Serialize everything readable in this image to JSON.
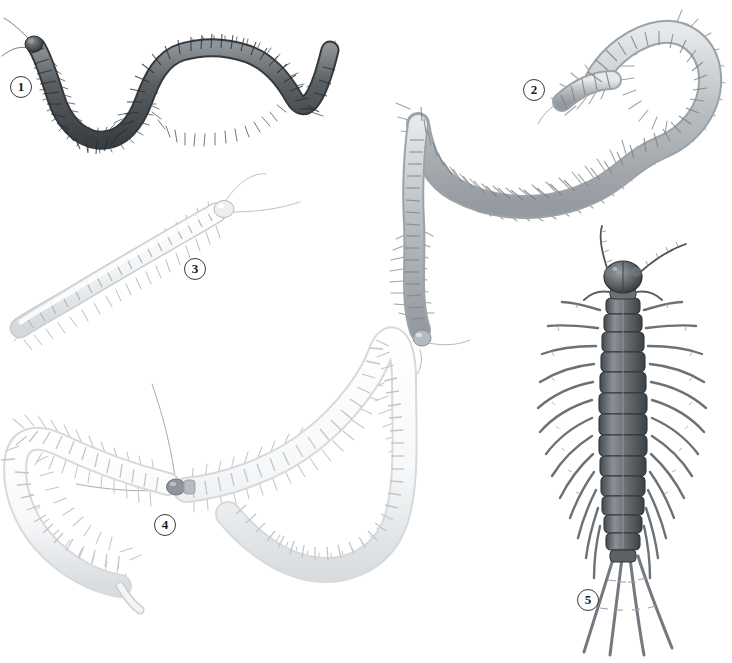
{
  "plate": {
    "title": "Centipede species comparison plate",
    "description": "Grayscale scientific illustration plate of five centipede specimens on a white background",
    "background_color": "#ffffff",
    "width": 732,
    "height": 663
  },
  "figures": [
    {
      "number": "1",
      "name": "specimen-1",
      "common_name": "dark banded centipede",
      "pose": "S-curved, sinuous, horizontal",
      "color": "#555a5e",
      "body_color_light": "#8e9498",
      "body_color_dark": "#3e4347",
      "segments": 46,
      "legs": "numerous fine bristled legs along both sides",
      "antennae": "two long thin antennae at left head",
      "head_position": "left",
      "label_position": {
        "x": 10,
        "y": 76
      }
    },
    {
      "number": "2",
      "name": "specimen-2",
      "common_name": "large pale scolopendromorph centipede",
      "pose": "long undulating S-curve from upper right to lower centre",
      "color": "#b9bec2",
      "body_color_light": "#e2e5e7",
      "body_color_dark": "#9aa0a5",
      "segments": 62,
      "legs": "long spiky legs projecting from each segment",
      "antennae": "two antennae at lower head end",
      "head_position": "lower-left end",
      "label_position": {
        "x": 523,
        "y": 79
      }
    },
    {
      "number": "3",
      "name": "specimen-3",
      "common_name": "pale soil centipede",
      "pose": "gentle diagonal arc from lower-left to upper-right",
      "color": "#e8eaec",
      "body_color_light": "#fbfbfc",
      "body_color_dark": "#c6cace",
      "segments": 28,
      "legs": "short fine legs on both sides",
      "antennae": "two very long thin antennae at upper right head",
      "head_position": "upper-right",
      "label_position": {
        "x": 184,
        "y": 258
      }
    },
    {
      "number": "4",
      "name": "specimen-4",
      "common_name": "white geophilomorph centipede",
      "pose": "large loop / heart-shaped coil",
      "color": "#eff1f2",
      "body_color_light": "#ffffff",
      "body_color_dark": "#cfd3d6",
      "segments": 66,
      "legs": "short spiky legs at every segment",
      "antennae": "two long curving antennae from the small dark head",
      "head_color": "#8b9095",
      "head_position": "centre-left of coil",
      "label_position": {
        "x": 154,
        "y": 514
      }
    },
    {
      "number": "5",
      "name": "specimen-5",
      "common_name": "stone centipede, dorsal view",
      "pose": "straight, head up, dorsal aspect",
      "color": "#5d6266",
      "body_color_light": "#989ea3",
      "body_color_dark": "#3d4246",
      "segments": 16,
      "leg_pairs": 15,
      "legs": "15 pairs of long lateral legs plus elongated trailing rear legs",
      "antennae": "two long segmented antennae splayed upward",
      "head_position": "top",
      "label_position": {
        "x": 577,
        "y": 589
      }
    }
  ],
  "label_style": {
    "shape": "circle-outline",
    "text_color": "#1a1a1a",
    "border_color": "#3a3a3a",
    "fill_color": "#ffffff"
  }
}
